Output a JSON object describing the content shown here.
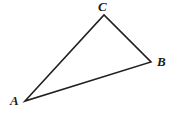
{
  "figure": {
    "kind": "triangle-diagram",
    "background_color": "#ffffff",
    "stroke_color": "#231f20",
    "stroke_width": 1.6,
    "width": 174,
    "height": 117
  },
  "labels": {
    "a": "A",
    "b": "B",
    "c": "C"
  },
  "chart_data": {
    "type": "diagram",
    "shape": "triangle",
    "title": "",
    "vertices": [
      {
        "name": "A",
        "x": 25,
        "y": 101,
        "label_x": 14,
        "label_y": 103
      },
      {
        "name": "B",
        "x": 151,
        "y": 62,
        "label_x": 161,
        "label_y": 65
      },
      {
        "name": "C",
        "x": 104,
        "y": 15,
        "label_x": 102,
        "label_y": 8
      }
    ],
    "edges": [
      {
        "from": "A",
        "to": "C"
      },
      {
        "from": "C",
        "to": "B"
      },
      {
        "from": "B",
        "to": "A"
      }
    ],
    "polygon_points": "25,101 104,15 151,62",
    "xlim": [
      0,
      174
    ],
    "ylim": [
      0,
      117
    ],
    "grid": false,
    "legend": null
  }
}
